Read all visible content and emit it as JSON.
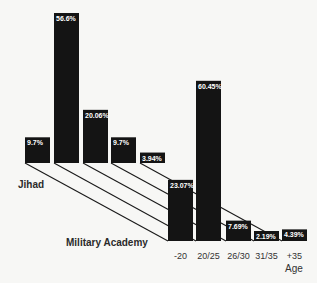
{
  "chart_data": {
    "type": "bar",
    "title": "",
    "xlabel": "Age",
    "ylabel": "",
    "categories": [
      "-20",
      "20/25",
      "26/30",
      "31/35",
      "+35"
    ],
    "series": [
      {
        "name": "Jihad",
        "values": [
          9.7,
          56.6,
          20.06,
          9.7,
          3.94
        ],
        "labels": [
          "9.7%",
          "56.6%",
          "20.06%",
          "9.7%",
          "3.94%"
        ]
      },
      {
        "name": "Military Academy",
        "values": [
          23.07,
          60.45,
          7.69,
          2.19,
          4.39
        ],
        "labels": [
          "23.07%",
          "60.45%",
          "7.69%",
          "2.19%",
          "4.39%"
        ]
      }
    ],
    "layout": "3D-style offset rows; Jihad row in back-left, Military Academy row in front-right, diagonal lines connect corresponding bars",
    "grid": false,
    "legend": "none (row labels placed beside rows)"
  },
  "labels": {
    "row1": "Jihad",
    "row2": "Military Academy",
    "axis": "Age"
  },
  "colors": {
    "bar": "#141414",
    "background": "#f7f7f5",
    "text": "#333333"
  }
}
